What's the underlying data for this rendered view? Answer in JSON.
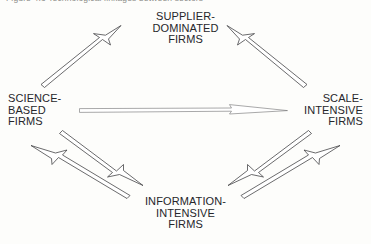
{
  "figure": {
    "caption_fragment": "Figure 4.3  Technological linkages between sectors",
    "background_color": "#fdfdfb",
    "ink_color": "#3a3a3c"
  },
  "nodes": [
    {
      "id": "supplier-dominated",
      "position": "top",
      "lines": [
        "SUPPLIER-",
        "DOMINATED",
        "FIRMS"
      ]
    },
    {
      "id": "science-based",
      "position": "left",
      "lines": [
        "SCIENCE-",
        "BASED",
        "FIRMS"
      ]
    },
    {
      "id": "scale-intensive",
      "position": "right",
      "lines": [
        "SCALE-",
        "INTENSIVE",
        "FIRMS"
      ]
    },
    {
      "id": "information-intensive",
      "position": "bottom",
      "lines": [
        "INFORMATION-",
        "INTENSIVE",
        "FIRMS"
      ]
    }
  ],
  "connectors": [
    {
      "id": "science-to-supplier",
      "from": "science-based",
      "to": "supplier-dominated",
      "style": "hollow-outline-arrow",
      "heads": 1,
      "direction": "up-right"
    },
    {
      "id": "scale-to-supplier",
      "from": "scale-intensive",
      "to": "supplier-dominated",
      "style": "hollow-outline-arrow",
      "heads": 1,
      "direction": "up-left"
    },
    {
      "id": "science-to-scale",
      "from": "science-based",
      "to": "scale-intensive",
      "style": "hollow-outline-arrow",
      "heads": 1,
      "direction": "right"
    },
    {
      "id": "information-to-science",
      "from": "information-intensive",
      "to": "science-based",
      "style": "hollow-outline-arrow",
      "heads": 1,
      "direction": "up-left"
    },
    {
      "id": "science-to-information",
      "from": "science-based",
      "to": "information-intensive",
      "style": "hollow-outline-arrow",
      "heads": 1,
      "direction": "down-right"
    },
    {
      "id": "scale-to-information",
      "from": "scale-intensive",
      "to": "information-intensive",
      "style": "hollow-outline-arrow",
      "heads": 1,
      "direction": "down-left"
    },
    {
      "id": "information-to-scale",
      "from": "information-intensive",
      "to": "scale-intensive",
      "style": "hollow-outline-arrow",
      "heads": 1,
      "direction": "up-right"
    }
  ]
}
